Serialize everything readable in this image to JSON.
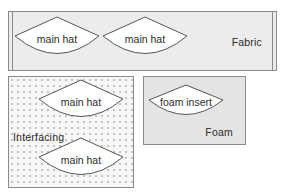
{
  "diagram": {
    "background_color": "#ffffff",
    "outline_color": "#555555"
  },
  "materials": [
    {
      "id": "fabric",
      "label": "Fabric",
      "fill_color": "#ececec",
      "border_color": "#8a8a8a",
      "has_selvage_edges": true,
      "pieces": [
        {
          "name": "main hat",
          "shape": "fan"
        },
        {
          "name": "main hat",
          "shape": "fan"
        }
      ]
    },
    {
      "id": "interfacing",
      "label": "Interfacing",
      "fill_color": "#f7f7f7",
      "border_color": "#8a8a8a",
      "texture": "dotted",
      "dot_color": "#c3c3c3",
      "pieces": [
        {
          "name": "main hat",
          "shape": "fan"
        },
        {
          "name": "main hat",
          "shape": "fan"
        }
      ]
    },
    {
      "id": "foam",
      "label": "Foam",
      "fill_color": "#e4e4e4",
      "border_color": "#8a8a8a",
      "pieces": [
        {
          "name": "foam insert",
          "shape": "fan"
        }
      ]
    }
  ],
  "piece_labels": {
    "fabric_1": "main hat",
    "fabric_2": "main hat",
    "interfacing_1": "main hat",
    "interfacing_2": "main hat",
    "foam_1": "foam insert"
  }
}
